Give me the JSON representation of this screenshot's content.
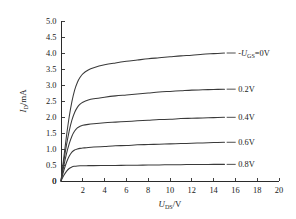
{
  "chart_data": {
    "type": "line",
    "title": "",
    "subtitle": "",
    "xlabel_parts": {
      "symbol": "U",
      "subscript": "DS",
      "unit": "/V"
    },
    "xlabel": "U_DS/V",
    "ylabel_parts": {
      "symbol": "I",
      "subscript": "D",
      "unit": "/mA"
    },
    "ylabel": "I_D/mA",
    "xlim": [
      0,
      20
    ],
    "ylim": [
      0,
      5.0
    ],
    "xticks": [
      0,
      2,
      4,
      6,
      8,
      10,
      12,
      14,
      16,
      18,
      20
    ],
    "xticklabels": [
      "0",
      "2",
      "4",
      "6",
      "8",
      "10",
      "12",
      "14",
      "16",
      "18",
      "20"
    ],
    "yticks": [
      0,
      0.5,
      1.0,
      1.5,
      2.0,
      2.5,
      3.0,
      3.5,
      4.0,
      4.5,
      5.0
    ],
    "yticklabels": [
      "0",
      "0.5",
      "1.0",
      "1.5",
      "2.0",
      "2.5",
      "3.0",
      "3.5",
      "4.0",
      "4.5",
      "5.0"
    ],
    "grid": false,
    "legend_position": "inline-right-of-curves",
    "annotations": [
      {
        "text": "-U_GS=0V",
        "prefix": "-",
        "symbol": "U",
        "subscript": "GS",
        "suffix": "=0V",
        "x": 15.2,
        "y": 4.0
      },
      {
        "text": "0.2V",
        "x": 15.2,
        "y": 2.87
      },
      {
        "text": "0.4V",
        "x": 15.2,
        "y": 1.99
      },
      {
        "text": "0.6V",
        "x": 15.2,
        "y": 1.21
      },
      {
        "text": "0.8V",
        "x": 15.2,
        "y": 0.52
      }
    ],
    "series": [
      {
        "name": "-U_GS=0V",
        "label": "-U_GS=0V",
        "saturation_current": 4.0,
        "x": [
          0,
          0.25,
          0.5,
          0.75,
          1.0,
          1.25,
          1.5,
          1.75,
          2.0,
          2.5,
          3.0,
          4.0,
          5.0,
          6.0,
          7.0,
          8.0,
          9.0,
          10.0,
          11.0,
          12.0,
          13.0,
          14.0,
          15.0
        ],
        "y": [
          0,
          0.72,
          1.4,
          2.0,
          2.48,
          2.84,
          3.08,
          3.24,
          3.35,
          3.47,
          3.54,
          3.63,
          3.69,
          3.74,
          3.78,
          3.82,
          3.85,
          3.88,
          3.91,
          3.93,
          3.96,
          3.98,
          4.0
        ]
      },
      {
        "name": "0.2V",
        "label": "0.2V",
        "saturation_current": 2.87,
        "x": [
          0,
          0.25,
          0.5,
          0.75,
          1.0,
          1.25,
          1.5,
          1.75,
          2.0,
          2.5,
          3.0,
          4.0,
          5.0,
          6.0,
          7.0,
          8.0,
          9.0,
          10.0,
          11.0,
          12.0,
          13.0,
          14.0,
          15.0
        ],
        "y": [
          0,
          0.6,
          1.12,
          1.56,
          1.9,
          2.14,
          2.3,
          2.4,
          2.46,
          2.53,
          2.57,
          2.62,
          2.66,
          2.69,
          2.72,
          2.75,
          2.78,
          2.8,
          2.82,
          2.84,
          2.85,
          2.86,
          2.87
        ]
      },
      {
        "name": "0.4V",
        "label": "0.4V",
        "saturation_current": 1.99,
        "x": [
          0,
          0.25,
          0.5,
          0.75,
          1.0,
          1.25,
          1.5,
          1.75,
          2.0,
          2.5,
          3.0,
          4.0,
          5.0,
          6.0,
          7.0,
          8.0,
          9.0,
          10.0,
          11.0,
          12.0,
          13.0,
          14.0,
          15.0
        ],
        "y": [
          0,
          0.46,
          0.85,
          1.16,
          1.4,
          1.56,
          1.66,
          1.71,
          1.74,
          1.77,
          1.79,
          1.82,
          1.84,
          1.86,
          1.88,
          1.9,
          1.92,
          1.93,
          1.95,
          1.96,
          1.97,
          1.98,
          1.99
        ]
      },
      {
        "name": "0.6V",
        "label": "0.6V",
        "saturation_current": 1.21,
        "x": [
          0,
          0.25,
          0.5,
          0.75,
          1.0,
          1.25,
          1.5,
          1.75,
          2.0,
          2.5,
          3.0,
          4.0,
          5.0,
          6.0,
          7.0,
          8.0,
          9.0,
          10.0,
          11.0,
          12.0,
          13.0,
          14.0,
          15.0
        ],
        "y": [
          0,
          0.32,
          0.58,
          0.77,
          0.9,
          0.97,
          1.0,
          1.02,
          1.03,
          1.05,
          1.06,
          1.08,
          1.1,
          1.11,
          1.13,
          1.14,
          1.15,
          1.16,
          1.17,
          1.18,
          1.19,
          1.2,
          1.21
        ]
      },
      {
        "name": "0.8V",
        "label": "0.8V",
        "saturation_current": 0.52,
        "x": [
          0,
          0.25,
          0.5,
          0.75,
          1.0,
          1.25,
          1.5,
          1.75,
          2.0,
          2.5,
          3.0,
          4.0,
          5.0,
          6.0,
          7.0,
          8.0,
          9.0,
          10.0,
          11.0,
          12.0,
          13.0,
          14.0,
          15.0
        ],
        "y": [
          0,
          0.17,
          0.3,
          0.39,
          0.44,
          0.46,
          0.47,
          0.475,
          0.478,
          0.48,
          0.481,
          0.484,
          0.487,
          0.49,
          0.494,
          0.498,
          0.503,
          0.507,
          0.511,
          0.515,
          0.517,
          0.519,
          0.52
        ]
      }
    ],
    "colors": {
      "curve": "#3a3a3a",
      "axis": "#2b2b2b",
      "text": "#1a1a1a",
      "background": "#ffffff"
    }
  }
}
